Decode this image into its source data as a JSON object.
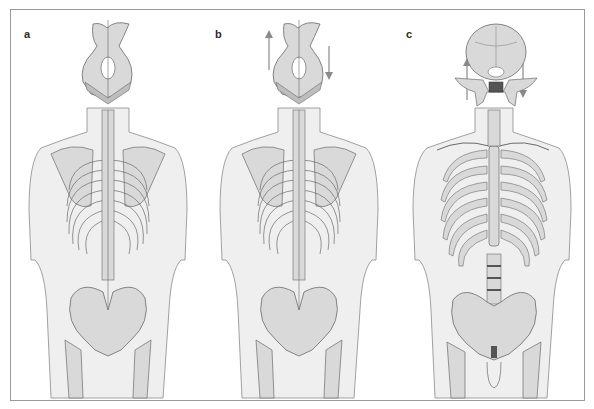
{
  "figure": {
    "panels": [
      {
        "label": "a",
        "view": "posterior",
        "skull": "occipital-base",
        "arrows": false
      },
      {
        "label": "b",
        "view": "posterior",
        "skull": "occipital-base",
        "arrows": true
      },
      {
        "label": "c",
        "view": "anterior",
        "skull": "cranial-base",
        "arrows": true
      }
    ]
  },
  "colors": {
    "bone_fill": "#d9d9d9",
    "bone_dark": "#bdbdbd",
    "body_fill": "#efefef",
    "outline": "#6a6a6a",
    "arrow": "#8a8a8a",
    "label": "#2a2a2a"
  }
}
